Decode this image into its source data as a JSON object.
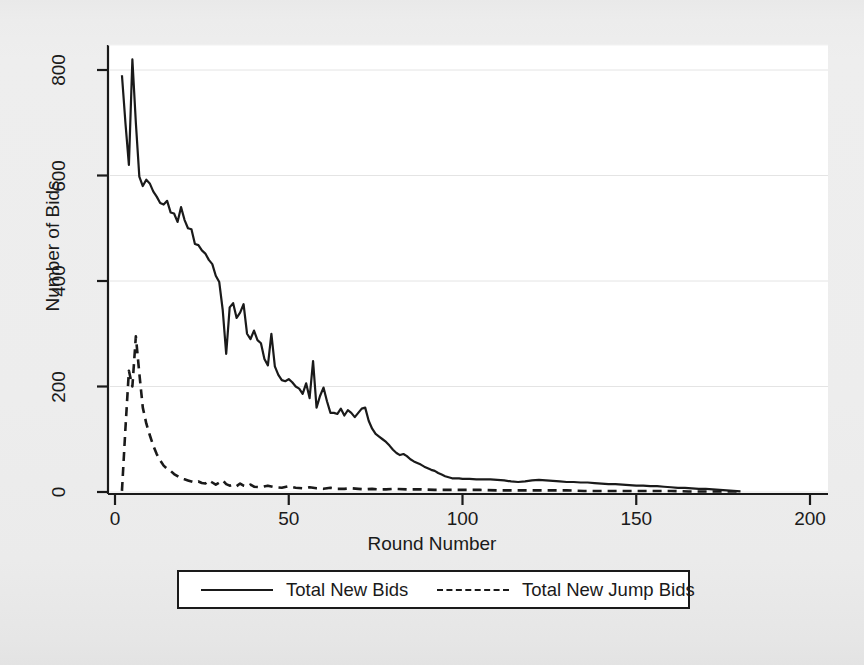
{
  "chart_data": {
    "type": "line",
    "title": "",
    "xlabel": "Round Number",
    "ylabel": "Number of Bids",
    "xlim": [
      0,
      200
    ],
    "ylim": [
      0,
      860
    ],
    "xticks": [
      0,
      50,
      100,
      150,
      200
    ],
    "yticks": [
      0,
      200,
      400,
      600,
      800
    ],
    "grid": "horizontal",
    "legend_position": "below-axes",
    "series": [
      {
        "name": "Total New Bids",
        "style": "solid",
        "color": "#1a1a1a",
        "x": [
          2,
          3,
          4,
          5,
          6,
          7,
          8,
          9,
          10,
          11,
          12,
          13,
          14,
          15,
          16,
          17,
          18,
          19,
          20,
          21,
          22,
          23,
          24,
          25,
          26,
          27,
          28,
          29,
          30,
          31,
          32,
          33,
          34,
          35,
          36,
          37,
          38,
          39,
          40,
          41,
          42,
          43,
          44,
          45,
          46,
          47,
          48,
          49,
          50,
          51,
          52,
          53,
          54,
          55,
          56,
          57,
          58,
          59,
          60,
          61,
          62,
          63,
          64,
          65,
          66,
          67,
          68,
          69,
          70,
          71,
          72,
          73,
          74,
          75,
          76,
          77,
          78,
          79,
          80,
          81,
          82,
          83,
          84,
          85,
          86,
          87,
          88,
          89,
          90,
          91,
          92,
          93,
          94,
          95,
          96,
          97,
          98,
          99,
          100,
          102,
          104,
          106,
          108,
          110,
          112,
          114,
          116,
          118,
          120,
          122,
          124,
          126,
          128,
          130,
          132,
          134,
          136,
          138,
          140,
          142,
          144,
          146,
          148,
          150,
          152,
          154,
          156,
          158,
          160,
          162,
          164,
          166,
          168,
          170,
          172,
          174,
          176,
          178,
          180
        ],
        "y": [
          790,
          700,
          620,
          820,
          700,
          598,
          580,
          592,
          585,
          570,
          560,
          548,
          545,
          552,
          530,
          528,
          512,
          540,
          516,
          500,
          498,
          470,
          468,
          458,
          452,
          440,
          432,
          410,
          398,
          345,
          262,
          350,
          358,
          330,
          340,
          356,
          300,
          290,
          306,
          288,
          282,
          252,
          240,
          300,
          238,
          222,
          212,
          210,
          214,
          208,
          200,
          196,
          186,
          206,
          178,
          248,
          160,
          182,
          198,
          172,
          150,
          150,
          148,
          158,
          145,
          155,
          150,
          142,
          150,
          158,
          160,
          135,
          120,
          110,
          105,
          100,
          95,
          88,
          80,
          74,
          70,
          72,
          68,
          62,
          58,
          55,
          52,
          48,
          45,
          42,
          40,
          36,
          33,
          30,
          28,
          26,
          26,
          26,
          25,
          25,
          24,
          24,
          24,
          23,
          22,
          20,
          19,
          20,
          22,
          23,
          22,
          21,
          20,
          19,
          19,
          18,
          18,
          17,
          16,
          15,
          15,
          14,
          13,
          12,
          12,
          11,
          11,
          10,
          9,
          8,
          8,
          7,
          6,
          6,
          5,
          4,
          3,
          2,
          1
        ]
      },
      {
        "name": "Total New Jump Bids",
        "style": "dashed",
        "color": "#1a1a1a",
        "x": [
          2,
          3,
          4,
          5,
          6,
          7,
          8,
          9,
          10,
          11,
          12,
          13,
          14,
          15,
          16,
          17,
          18,
          19,
          20,
          21,
          22,
          23,
          24,
          25,
          26,
          27,
          28,
          29,
          30,
          31,
          32,
          33,
          34,
          35,
          36,
          37,
          38,
          39,
          40,
          42,
          44,
          46,
          48,
          50,
          52,
          54,
          56,
          58,
          60,
          62,
          64,
          66,
          68,
          70,
          72,
          74,
          76,
          78,
          80,
          84,
          88,
          92,
          96,
          100,
          105,
          110,
          115,
          120,
          125,
          130,
          135,
          140,
          145,
          150,
          155,
          160,
          165,
          170,
          175,
          180
        ],
        "y": [
          2,
          120,
          230,
          200,
          295,
          225,
          160,
          130,
          108,
          88,
          72,
          60,
          50,
          44,
          40,
          34,
          30,
          26,
          24,
          22,
          20,
          18,
          20,
          17,
          16,
          22,
          18,
          14,
          18,
          22,
          15,
          12,
          14,
          11,
          16,
          12,
          10,
          14,
          10,
          9,
          12,
          9,
          8,
          11,
          8,
          7,
          9,
          7,
          6,
          8,
          6,
          6,
          7,
          6,
          5,
          6,
          5,
          5,
          6,
          5,
          5,
          4,
          4,
          4,
          4,
          3,
          3,
          3,
          3,
          3,
          2,
          2,
          2,
          2,
          2,
          2,
          1,
          1,
          1,
          1
        ]
      }
    ]
  },
  "axes": {
    "ylabel": "Number of Bids",
    "xlabel": "Round Number",
    "yticks": [
      "0",
      "200",
      "400",
      "600",
      "800"
    ],
    "xticks": [
      "0",
      "50",
      "100",
      "150",
      "200"
    ]
  },
  "legend": {
    "entries": [
      {
        "label": "Total New Bids",
        "style": "solid"
      },
      {
        "label": "Total New Jump Bids",
        "style": "dashed"
      }
    ]
  }
}
